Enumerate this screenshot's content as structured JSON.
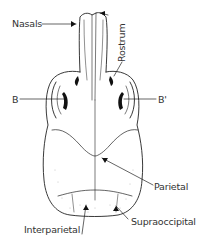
{
  "figure": {
    "labels": {
      "nasals": "Nasals",
      "rostrum": "Rostrum",
      "b": "B",
      "b_prime": "B'",
      "parietal": "Parietal",
      "interparietal": "Interparietal",
      "supraoccipital": "Supraoccipital"
    },
    "colors": {
      "ink": "#222222",
      "label_text": "#333333",
      "background": "#ffffff"
    }
  }
}
